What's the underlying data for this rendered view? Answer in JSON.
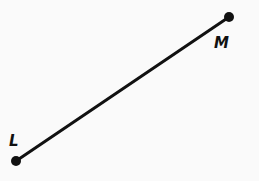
{
  "diagram": {
    "type": "line-segment",
    "points": [
      {
        "name": "L",
        "label": "L",
        "x": 16,
        "y": 161,
        "label_x": 10,
        "label_y": 146
      },
      {
        "name": "M",
        "label": "M",
        "x": 229,
        "y": 17,
        "label_x": 216,
        "label_y": 48
      }
    ],
    "segment": {
      "from": "L",
      "to": "M",
      "color": "#111111",
      "width": 3
    }
  }
}
